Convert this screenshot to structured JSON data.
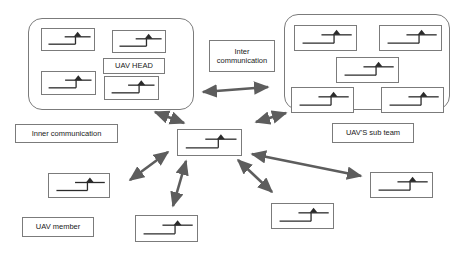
{
  "diagram": {
    "line_color": "#7b7b7b",
    "arrow_color": "#5d5d5d",
    "icon_color": "#2b2b2b",
    "labels": {
      "uav_head": "UAV HEAD",
      "inter_communication": "Inter\ncommunication",
      "inner_communication": "Inner communication",
      "uav_sub_team": "UAV'S sub team",
      "uav_member": "UAV member"
    },
    "groups": [
      {
        "name": "head-group",
        "x": 28,
        "y": 18,
        "w": 166,
        "h": 92
      },
      {
        "name": "sub-team-group",
        "x": 284,
        "y": 14,
        "w": 166,
        "h": 96
      }
    ],
    "text_boxes": [
      {
        "name": "uav-head-label",
        "key": "uav_head",
        "x": 103,
        "y": 58,
        "w": 62,
        "h": 16
      },
      {
        "name": "inter-communication-label",
        "key": "inter_communication",
        "x": 209,
        "y": 40,
        "w": 66,
        "h": 32
      },
      {
        "name": "inner-communication-label",
        "key": "inner_communication",
        "x": 15,
        "y": 124,
        "w": 103,
        "h": 19
      },
      {
        "name": "uav-sub-team-label",
        "key": "uav_sub_team",
        "x": 332,
        "y": 123,
        "w": 82,
        "h": 20
      },
      {
        "name": "uav-member-label",
        "key": "uav_member",
        "x": 22,
        "y": 217,
        "w": 72,
        "h": 20
      }
    ],
    "uav_nodes": [
      {
        "name": "uav-head-member-1",
        "x": 41,
        "y": 28,
        "w": 54,
        "h": 23
      },
      {
        "name": "uav-head-member-2",
        "x": 112,
        "y": 30,
        "w": 54,
        "h": 23
      },
      {
        "name": "uav-head-member-3",
        "x": 41,
        "y": 71,
        "w": 55,
        "h": 24
      },
      {
        "name": "uav-head-member-4",
        "x": 104,
        "y": 76,
        "w": 55,
        "h": 24
      },
      {
        "name": "uav-subteam-member-1",
        "x": 294,
        "y": 25,
        "w": 63,
        "h": 26
      },
      {
        "name": "uav-subteam-member-2",
        "x": 379,
        "y": 25,
        "w": 63,
        "h": 26
      },
      {
        "name": "uav-subteam-member-3",
        "x": 336,
        "y": 57,
        "w": 63,
        "h": 26
      },
      {
        "name": "uav-subteam-member-4",
        "x": 291,
        "y": 87,
        "w": 63,
        "h": 26
      },
      {
        "name": "uav-subteam-member-5",
        "x": 381,
        "y": 87,
        "w": 63,
        "h": 26
      },
      {
        "name": "uav-center-node",
        "x": 177,
        "y": 129,
        "w": 65,
        "h": 27
      },
      {
        "name": "uav-member-left",
        "x": 48,
        "y": 173,
        "w": 62,
        "h": 25
      },
      {
        "name": "uav-member-bottom-left",
        "x": 135,
        "y": 215,
        "w": 63,
        "h": 27
      },
      {
        "name": "uav-member-bottom-center",
        "x": 271,
        "y": 203,
        "w": 63,
        "h": 26
      },
      {
        "name": "uav-member-right",
        "x": 370,
        "y": 172,
        "w": 63,
        "h": 26
      }
    ],
    "arrows": [
      {
        "name": "arrow-head-to-subteam",
        "x1": 199,
        "y1": 92,
        "x2": 272,
        "y2": 87,
        "double": true
      },
      {
        "name": "arrow-center-to-head",
        "x1": 186,
        "y1": 124,
        "x2": 152,
        "y2": 111,
        "double": true
      },
      {
        "name": "arrow-center-to-subteam",
        "x1": 253,
        "y1": 123,
        "x2": 288,
        "y2": 113,
        "double": true
      },
      {
        "name": "arrow-center-to-left",
        "x1": 170,
        "y1": 150,
        "x2": 126,
        "y2": 182,
        "double": true
      },
      {
        "name": "arrow-center-to-bottom-left",
        "x1": 184,
        "y1": 160,
        "x2": 171,
        "y2": 208,
        "double": true
      },
      {
        "name": "arrow-center-to-bottom-center",
        "x1": 237,
        "y1": 159,
        "x2": 275,
        "y2": 193,
        "double": true
      },
      {
        "name": "arrow-center-to-right",
        "x1": 251,
        "y1": 153,
        "x2": 360,
        "y2": 176,
        "double": true
      }
    ]
  }
}
